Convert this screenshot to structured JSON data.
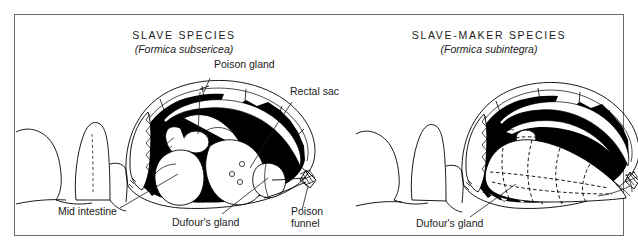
{
  "figure": {
    "kind": "anatomical-diagram",
    "border_color": "#6b6b6b",
    "ink_color": "#000000",
    "text_color": "#1b1b1b",
    "background_color": "#ffffff"
  },
  "panels": [
    {
      "id": "slave-species",
      "title": "SLAVE SPECIES",
      "subtitle": "(Formica subsericea)",
      "callouts": [
        {
          "id": "poison-gland",
          "text": "Poison gland"
        },
        {
          "id": "rectal-sac",
          "text": "Rectal sac"
        },
        {
          "id": "mid-intestine",
          "text": "Mid intestine"
        },
        {
          "id": "dufours-gland",
          "text": "Dufour's gland"
        },
        {
          "id": "poison-funnel-1",
          "text": "Poison"
        },
        {
          "id": "poison-funnel-2",
          "text": "funnel"
        }
      ]
    },
    {
      "id": "slave-maker-species",
      "title": "SLAVE-MAKER SPECIES",
      "subtitle": "(Formica subintegra)",
      "callouts": [
        {
          "id": "dufours-gland",
          "text": "Dufour's gland"
        }
      ]
    }
  ]
}
